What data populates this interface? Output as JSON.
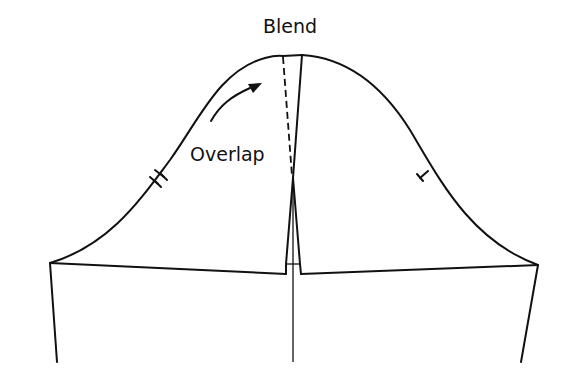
{
  "diagram": {
    "type": "sleeve-cap pattern draft",
    "labels": {
      "top": "Blend",
      "middle": "Overlap"
    },
    "annotations": {
      "arrow": "curved arrow pointing toward blended cap",
      "left_notch": "double notch mark",
      "right_notch": "single notch mark",
      "dashed_line": "blend line at overlap"
    },
    "colors": {
      "line": "#111111",
      "background": "#ffffff"
    }
  }
}
